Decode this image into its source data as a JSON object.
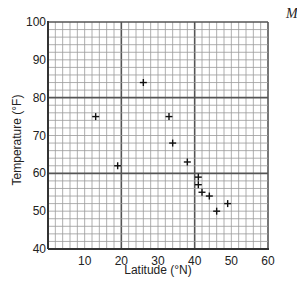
{
  "chart_data": {
    "type": "scatter",
    "title": "",
    "xlabel": "Latitude (°N)",
    "ylabel": "Temperature (°F)",
    "xlim": [
      0,
      60
    ],
    "ylim": [
      40,
      100
    ],
    "x_ticks": [
      10,
      20,
      30,
      40,
      50,
      60
    ],
    "y_ticks": [
      40,
      50,
      60,
      70,
      80,
      90,
      100
    ],
    "grid": true,
    "minor_grid_step": 2,
    "major_grid_step": 20,
    "marker": "+",
    "points": [
      {
        "x": 13,
        "y": 75
      },
      {
        "x": 19,
        "y": 62
      },
      {
        "x": 26,
        "y": 84
      },
      {
        "x": 33,
        "y": 75
      },
      {
        "x": 34,
        "y": 68
      },
      {
        "x": 38,
        "y": 63
      },
      {
        "x": 41,
        "y": 59
      },
      {
        "x": 41,
        "y": 57
      },
      {
        "x": 42,
        "y": 55
      },
      {
        "x": 44,
        "y": 54
      },
      {
        "x": 46,
        "y": 50
      },
      {
        "x": 49,
        "y": 52
      }
    ]
  },
  "corner_text": "M",
  "colors": {
    "minor_grid": "#9a9a9a",
    "major_grid": "#555555",
    "axis": "#333333",
    "marker": "#111111"
  }
}
